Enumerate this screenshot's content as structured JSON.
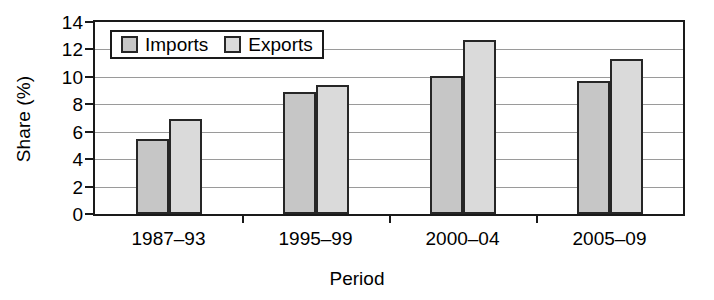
{
  "chart_data": {
    "type": "bar",
    "title": "",
    "subtitle": "",
    "xlabel": "Period",
    "ylabel": "Share (%)",
    "categories": [
      "1987–93",
      "1995–99",
      "2000–04",
      "2005–09"
    ],
    "series": [
      {
        "name": "Imports",
        "values": [
          5.5,
          8.9,
          10.1,
          9.7
        ],
        "color": "#c6c6c6"
      },
      {
        "name": "Exports",
        "values": [
          6.9,
          9.4,
          12.7,
          11.3
        ],
        "color": "#dadada"
      }
    ],
    "ylim": [
      0,
      14
    ],
    "ytick_labels": [
      "0",
      "2",
      "4",
      "6",
      "8",
      "10",
      "12",
      "14"
    ],
    "ytick_values": [
      0,
      2,
      4,
      6,
      8,
      10,
      12,
      14
    ],
    "grid": "horizontal",
    "legend_position": "upper left inside",
    "axis_frame": true,
    "bar_edge_color": "#262626",
    "gridline_color": "#9a9a9a"
  },
  "legend": {
    "entries": [
      {
        "label": "Imports"
      },
      {
        "label": "Exports"
      }
    ]
  }
}
